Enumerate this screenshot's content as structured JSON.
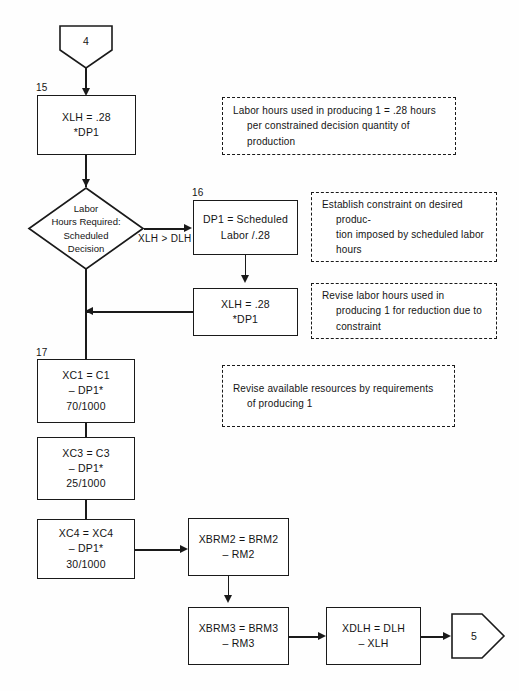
{
  "diagram": {
    "line_color": "#1a1a1a",
    "background": "#fefefe"
  },
  "terminals": {
    "entry": {
      "label": "4",
      "name": "connector-4"
    },
    "exit": {
      "label": "5",
      "name": "connector-5"
    }
  },
  "step_numbers": {
    "s15": "15",
    "s16": "16",
    "s17": "17"
  },
  "nodes": {
    "xlh_initial": {
      "text": "XLH = .28\n*DP1"
    },
    "decision": {
      "text": "Labor\nHours Required:\nScheduled\nDecision"
    },
    "dp1_scheduled": {
      "text": "DP1 = Scheduled\nLabor /.28"
    },
    "xlh_revised": {
      "text": "XLH = .28\n*DP1"
    },
    "xc1": {
      "text": "XC1 = C1\n– DP1*\n70/1000"
    },
    "xc3": {
      "text": "XC3 = C3\n– DP1*\n25/1000"
    },
    "xc4": {
      "text": "XC4 = XC4\n– DP1*\n30/1000"
    },
    "xbrm2": {
      "text": "XBRM2 = BRM2\n– RM2"
    },
    "xbrm3": {
      "text": "XBRM3 = BRM3\n– RM3"
    },
    "xdlh": {
      "text": "XDLH = DLH\n– XLH"
    }
  },
  "branches": {
    "xlh_gt_dlh": "XLH > DLH"
  },
  "annotations": {
    "a1": "Labor hours used in producing 1 = .28 hours per constrained decision quantity of production",
    "a2": "Establish constraint on desired produc-\ntion imposed by scheduled labor\nhours",
    "a3": "Revise labor hours used in producing 1 for reduction due to constraint",
    "a4": "Revise available resources by requirements of producing 1"
  }
}
